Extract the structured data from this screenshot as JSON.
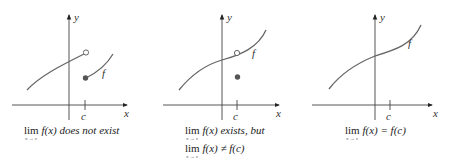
{
  "panels": [
    {
      "id": "does-not-exist",
      "axis_x_label": "x",
      "axis_y_label": "y",
      "tick_label": "c",
      "function_label": "f",
      "caption": {
        "lim": "lim",
        "sub": "x → c",
        "expr": "f(x) does not exist"
      }
    },
    {
      "id": "exists-not-equal",
      "axis_x_label": "x",
      "axis_y_label": "y",
      "tick_label": "c",
      "function_label": "f",
      "caption": {
        "line1_lim": "lim",
        "line1_sub": "x → c",
        "line1_expr": "f(x) exists, but",
        "line2_lim": "lim",
        "line2_sub": "x → c",
        "line2_expr": "f(x) ≠ f(c)"
      }
    },
    {
      "id": "continuous",
      "axis_x_label": "x",
      "axis_y_label": "y",
      "tick_label": "c",
      "function_label": "f",
      "caption": {
        "lim": "lim",
        "sub": "x → c",
        "expr": "f(x) = f(c)"
      }
    }
  ],
  "colors": {
    "axis": "#444444",
    "curve": "#666666",
    "filled_point": "#555555"
  }
}
